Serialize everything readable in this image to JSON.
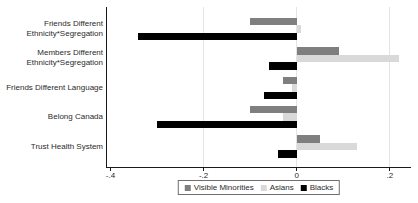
{
  "figure": {
    "background": "#ffffff",
    "axis_color": "#1a1a1a",
    "grid_color": "#e4e4e4",
    "text_color": "#2b2b2b"
  },
  "chart_data": {
    "type": "bar",
    "orientation": "horizontal",
    "title": "",
    "xlabel": "",
    "ylabel": "",
    "categories": [
      "Friends Different Ethnicity*Segregation",
      "Members Different Ethnicity*Segregation",
      "Friends Different Language",
      "Belong Canada",
      "Trust Health System"
    ],
    "category_display": [
      [
        "Friends Different",
        "Ethnicity*Segregation"
      ],
      [
        "Members Different",
        "Ethnicity*Segregation"
      ],
      [
        "Friends Different Language"
      ],
      [
        "Belong Canada"
      ],
      [
        "Trust Health System"
      ]
    ],
    "series": [
      {
        "name": "Visible Minorities",
        "color": "#7f7f7f",
        "values": [
          -0.1,
          0.09,
          -0.03,
          -0.1,
          0.05
        ]
      },
      {
        "name": "Asians",
        "color": "#d9d9d9",
        "values": [
          0.01,
          0.22,
          -0.01,
          -0.03,
          0.13
        ]
      },
      {
        "name": "Blacks",
        "color": "#000000",
        "values": [
          -0.34,
          -0.06,
          -0.07,
          -0.3,
          -0.04
        ]
      }
    ],
    "xlim": [
      -0.4075,
      0.2435
    ],
    "x_ticks": [
      {
        "value": -0.4,
        "label": "-.4"
      },
      {
        "value": -0.2,
        "label": "-.2"
      },
      {
        "value": 0,
        "label": "0"
      },
      {
        "value": 0.2,
        "label": ".2"
      }
    ],
    "gridlines_at": [
      -0.2,
      0,
      0.2
    ],
    "grid": true,
    "legend_position": "bottom-center",
    "legend_entries": [
      "Visible Minorities",
      "Asians",
      "Blacks"
    ]
  }
}
